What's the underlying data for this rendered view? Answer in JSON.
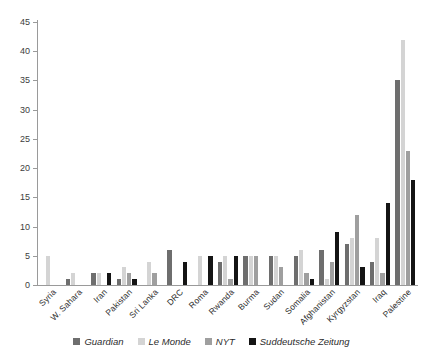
{
  "chart_data": {
    "type": "bar",
    "title": "",
    "xlabel": "",
    "ylabel": "",
    "ylim": [
      0,
      45
    ],
    "ytick_step": 5,
    "yticks": [
      0,
      5,
      10,
      15,
      20,
      25,
      30,
      35,
      40,
      45
    ],
    "grid": false,
    "legend_position": "bottom",
    "categories": [
      "Syria",
      "W. Sahara",
      "Iran",
      "Pakistan",
      "Sri Lanka",
      "DRC",
      "Roma",
      "Rwanda",
      "Burma",
      "Sudan",
      "Somalia",
      "Afghanistan",
      "Kyrgyzstan",
      "Iraq",
      "Palestine"
    ],
    "series": [
      {
        "name": "Guardian",
        "color": "#6e6e6e",
        "values": [
          0,
          1,
          2,
          1,
          0,
          6,
          0,
          4,
          5,
          5,
          5,
          6,
          7,
          4,
          35
        ]
      },
      {
        "name": "Le Monde",
        "color": "#d4d4d4",
        "values": [
          5,
          2,
          2,
          3,
          4,
          0,
          5,
          5,
          5,
          5,
          6,
          1,
          8,
          8,
          42
        ]
      },
      {
        "name": "NYT",
        "color": "#9f9f9f",
        "values": [
          0,
          0,
          0,
          2,
          2,
          0,
          0,
          1,
          5,
          3,
          2,
          4,
          12,
          2,
          23
        ]
      },
      {
        "name": "Suddeutsche Zeitung",
        "color": "#141414",
        "values": [
          0,
          0,
          2,
          1,
          0,
          4,
          5,
          5,
          0,
          0,
          1,
          9,
          3,
          14,
          18
        ]
      }
    ]
  },
  "legend": {
    "items": [
      {
        "label": "Guardian",
        "color": "#6e6e6e"
      },
      {
        "label": "Le Monde",
        "color": "#d4d4d4"
      },
      {
        "label": "NYT",
        "color": "#9f9f9f"
      },
      {
        "label": "Suddeutsche Zeitung",
        "color": "#141414"
      }
    ]
  }
}
